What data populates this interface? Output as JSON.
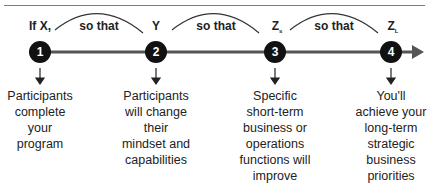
{
  "diagram": {
    "nodes": [
      {
        "number": "1",
        "top_label": "If X,",
        "sub": "",
        "x": 40,
        "description": [
          "Participants",
          "complete",
          "your",
          "program"
        ]
      },
      {
        "number": "2",
        "top_label": "Y",
        "sub": "",
        "x": 156,
        "description": [
          "Participants",
          "will change",
          "their",
          "mindset and",
          "capabilities"
        ]
      },
      {
        "number": "3",
        "top_label": "Z",
        "sub": "s",
        "x": 275,
        "description": [
          "Specific",
          "short-term",
          "business or",
          "operations",
          "functions will",
          "improve"
        ]
      },
      {
        "number": "4",
        "top_label": "Z",
        "sub": "L",
        "x": 391,
        "description": [
          "You'll",
          "achieve your",
          "long-term",
          "strategic",
          "business",
          "priorities"
        ]
      }
    ],
    "connectors": [
      {
        "label": "so that"
      },
      {
        "label": "so that"
      },
      {
        "label": "so that"
      }
    ],
    "colors": {
      "node_fill": "#111111",
      "line": "#555555",
      "text": "#222222"
    }
  }
}
